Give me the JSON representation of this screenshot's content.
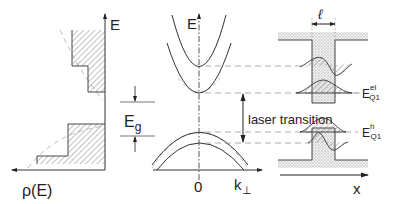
{
  "diagram": {
    "type": "semiconductor quantum well band structure",
    "panels": [
      {
        "id": "density-of-states",
        "axis_vertical_label": "E",
        "axis_horizontal_label": "ρ(E)"
      },
      {
        "id": "dispersion",
        "axis_vertical_label": "E",
        "axis_horizontal_label": "k",
        "axis_horizontal_subscript": "⊥",
        "origin_label": "0"
      },
      {
        "id": "quantum-well",
        "width_label": "ℓ",
        "axis_horizontal_label": "x",
        "electron_level_label": "E",
        "electron_level_sup": "el",
        "electron_level_sub": "Q1",
        "hole_level_label": "E",
        "hole_level_sup": "h",
        "hole_level_sub": "Q1"
      }
    ],
    "gap_label": "E",
    "gap_sub": "g",
    "transition_label": "laser transition"
  },
  "colors": {
    "line": "#333333",
    "dashed": "#999999",
    "hatch": "#777777",
    "dots": "#bbbbbb"
  }
}
